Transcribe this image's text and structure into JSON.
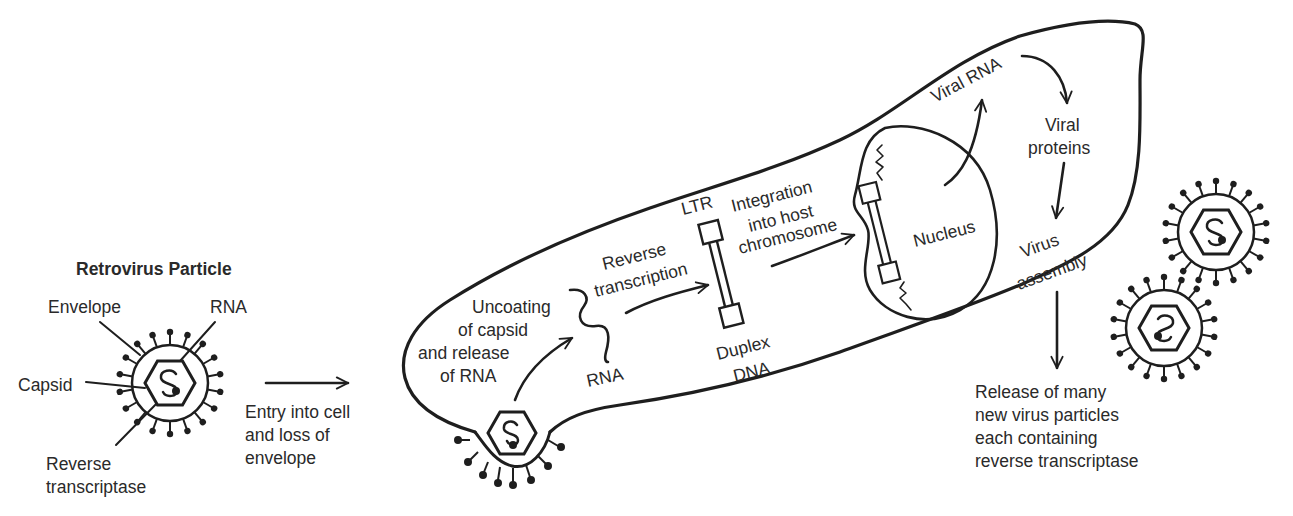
{
  "diagram": {
    "title": "Retrovirus Particle",
    "particle_labels": {
      "envelope": "Envelope",
      "rna": "RNA",
      "capsid": "Capsid",
      "rt_line1": "Reverse",
      "rt_line2": "transcriptase"
    },
    "entry_step": {
      "line1": "Entry into cell",
      "line2": "and loss of",
      "line3": "envelope"
    },
    "uncoating_step": {
      "line1": "Uncoating",
      "line2": "of capsid",
      "line3": "and release",
      "line4": "of RNA"
    },
    "rna_label": "RNA",
    "reverse_transcription": {
      "line1": "Reverse",
      "line2": "transcription"
    },
    "ltr_label": "LTR",
    "duplex_dna": {
      "line1": "Duplex",
      "line2": "DNA"
    },
    "integration_step": {
      "line1": "Integration",
      "line2": "into host",
      "line3": "chromosome"
    },
    "nucleus_label": "Nucleus",
    "viral_rna_label": "Viral RNA",
    "viral_proteins": {
      "line1": "Viral",
      "line2": "proteins"
    },
    "virus_assembly": {
      "line1": "Virus",
      "line2": "assembly"
    },
    "release_step": {
      "line1": "Release of many",
      "line2": "new virus particles",
      "line3": "each containing",
      "line4": "reverse transcriptase"
    },
    "colors": {
      "ink": "#1e1e1e",
      "text": "#2a2a2a",
      "background": "#ffffff"
    }
  }
}
